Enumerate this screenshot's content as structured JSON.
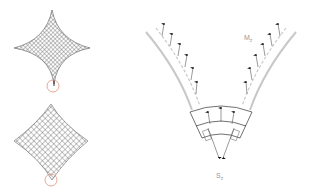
{
  "figure": {
    "panels": [
      {
        "id": "top-left",
        "shape": "concave star (cusped) mesh",
        "highlight": "circle at bottom vertex"
      },
      {
        "id": "bottom-left",
        "shape": "diamond mesh",
        "highlight": "circle at bottom vertex"
      },
      {
        "id": "right",
        "shape": "V-shaped strip with force arrows"
      }
    ],
    "labels": {
      "m_main": "M",
      "m_sub": "z",
      "s_main": "S",
      "s_sub": "z"
    },
    "colors": {
      "mesh": "#555555",
      "highlight_circle": "#e0937a",
      "strip": "#c8c8c8",
      "arrow": "#111111",
      "label": "#999999"
    }
  }
}
